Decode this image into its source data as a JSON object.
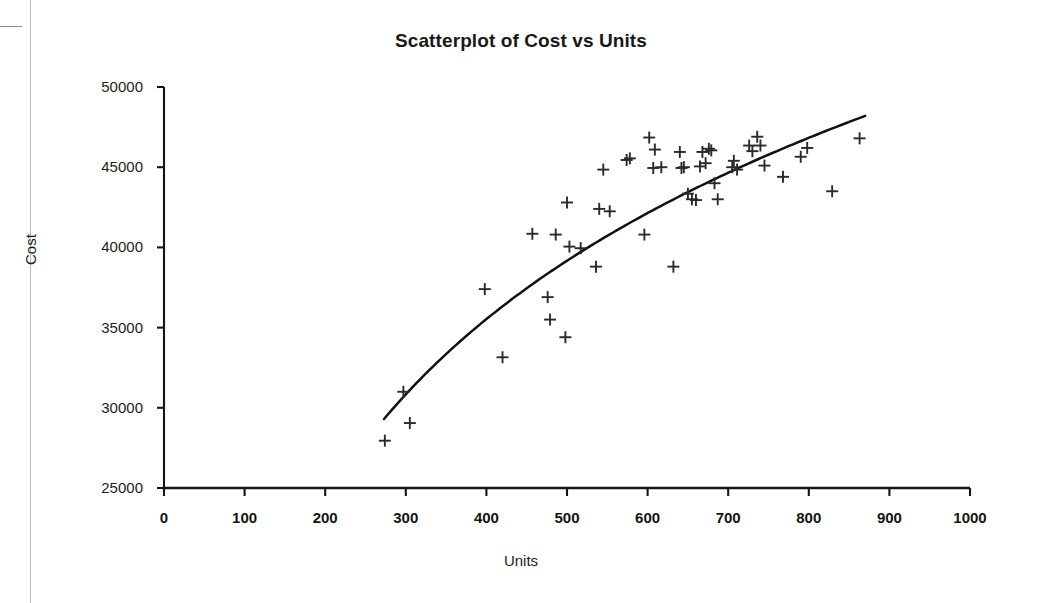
{
  "chart_data": {
    "type": "scatter",
    "title": "Scatterplot of Cost vs Units",
    "xlabel": "Units",
    "ylabel": "Cost",
    "xlim": [
      0,
      1000
    ],
    "ylim": [
      25000,
      50000
    ],
    "xticks": [
      0,
      100,
      200,
      300,
      400,
      500,
      600,
      700,
      800,
      900,
      1000
    ],
    "xtick_labels": [
      "0",
      "100",
      "200",
      "300",
      "400",
      "500",
      "600",
      "700",
      "800",
      "900",
      "1000"
    ],
    "yticks": [
      25000,
      30000,
      35000,
      40000,
      45000,
      50000
    ],
    "ytick_labels": [
      "25000",
      "30000",
      "35000",
      "40000",
      "45000",
      "50000"
    ],
    "grid": false,
    "legend": false,
    "marker": "plus",
    "marker_color": "#2a2a2a",
    "series": [
      {
        "name": "Cost vs Units",
        "x": [
          274,
          305,
          297,
          398,
          420,
          457,
          476,
          479,
          486,
          498,
          500,
          503,
          517,
          536,
          540,
          545,
          553,
          574,
          578,
          596,
          602,
          607,
          609,
          617,
          632,
          640,
          642,
          645,
          650,
          655,
          660,
          665,
          668,
          672,
          676,
          679,
          683,
          687,
          705,
          707,
          711,
          726,
          730,
          736,
          740,
          745,
          768,
          790,
          798,
          829,
          863
        ],
        "y": [
          27950,
          29050,
          31000,
          37400,
          33150,
          40850,
          36900,
          35500,
          40800,
          34400,
          42800,
          40050,
          39950,
          38800,
          42400,
          44850,
          42250,
          45450,
          45550,
          40800,
          46850,
          44950,
          46100,
          45000,
          38800,
          45950,
          44950,
          45000,
          43350,
          43000,
          42950,
          45050,
          45950,
          45250,
          46150,
          46050,
          44000,
          43000,
          45000,
          45400,
          44850,
          46350,
          46000,
          46900,
          46350,
          45100,
          44400,
          45650,
          46200,
          43500,
          46800
        ]
      }
    ],
    "trendline": {
      "type": "logarithmic-fit",
      "x_start": 273,
      "x_end": 870,
      "y_start": 29300,
      "y_end": 48200,
      "color": "#111111"
    }
  }
}
